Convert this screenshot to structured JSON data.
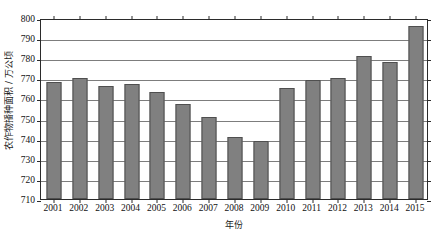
{
  "chart_data": {
    "type": "bar",
    "title": "",
    "subtitle": "",
    "xlabel": "年份",
    "ylabel": "农作物播种面积 / 万公顷",
    "categories": [
      "2001",
      "2002",
      "2003",
      "2004",
      "2005",
      "2006",
      "2007",
      "2008",
      "2009",
      "2010",
      "2011",
      "2012",
      "2013",
      "2014",
      "2015"
    ],
    "values": [
      768,
      770,
      766,
      767,
      763,
      757,
      751,
      741,
      739,
      765,
      769,
      770,
      781,
      778,
      796
    ],
    "ylim": [
      710,
      800
    ],
    "ytick_step": 10,
    "yticks": [
      "710",
      "720",
      "730",
      "740",
      "750",
      "760",
      "770",
      "780",
      "790",
      "800"
    ],
    "ytick_values": [
      710,
      720,
      730,
      740,
      750,
      760,
      770,
      780,
      790,
      800
    ],
    "grid": true,
    "grid_axis": "y",
    "legend": false,
    "legend_position": "none",
    "bar_color": "#808080",
    "bar_edge_color": "#4f4f4f",
    "grid_color": "#7d7d7d",
    "axis_color": "#2b2b2b",
    "background_color": "#ffffff",
    "series": [
      {
        "name": "农作物播种面积",
        "values": [
          768,
          770,
          766,
          767,
          763,
          757,
          751,
          741,
          739,
          765,
          769,
          770,
          781,
          778,
          796
        ]
      }
    ]
  }
}
